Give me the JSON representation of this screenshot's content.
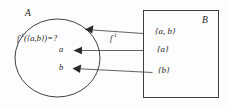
{
  "figure": {
    "type": "set-mapping-diagram",
    "background_color": "#fdfdfd",
    "ink_color": "#2b2b2b",
    "domain_set": {
      "name": "A",
      "shape": "ellipse",
      "elements": [
        "a",
        "b"
      ],
      "annotation_prefix": "f",
      "annotation_exponent": "-1",
      "annotation_suffix": "({a,b})=?"
    },
    "codomain_set": {
      "name": "B",
      "shape": "rectangle",
      "elements": [
        "{a, b}",
        "{a}",
        "{b}"
      ]
    },
    "map": {
      "label_prefix": "f",
      "label_exponent": "-1",
      "direction": "right-to-left"
    },
    "arrows": [
      {
        "from": "{a, b}",
        "to": "preimage-region"
      },
      {
        "from": "{a}",
        "to": "a"
      },
      {
        "from": "{b}",
        "to": "b"
      }
    ]
  }
}
